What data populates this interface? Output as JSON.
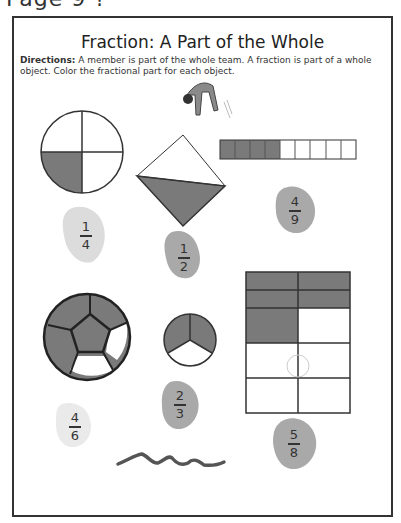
{
  "page_header": "Page 9 ?",
  "worksheet": {
    "title": "Fraction: A Part of the Whole",
    "directions_label": "Directions:",
    "directions_text": " A member is part of the whole team. A fraction is part of a whole object. Color the fractional part for each object."
  },
  "colors": {
    "shade": "#7a7a7a",
    "outline": "#333333",
    "blob_light": "#dcdcdc",
    "blob_dark": "#a9a9a9"
  },
  "objects": [
    {
      "name": "circle-quarters",
      "parts": 4,
      "shaded": 1,
      "fraction": {
        "num": "1",
        "den": "4"
      }
    },
    {
      "name": "diamond-halves",
      "parts": 2,
      "shaded": 1,
      "fraction": {
        "num": "1",
        "den": "2"
      }
    },
    {
      "name": "bar-ninths",
      "parts": 9,
      "shaded": 4,
      "fraction": {
        "num": "4",
        "den": "9"
      }
    },
    {
      "name": "soccer-ball",
      "parts": 6,
      "shaded": 4,
      "fraction": {
        "num": "4",
        "den": "6"
      }
    },
    {
      "name": "circle-thirds",
      "parts": 3,
      "shaded": 2,
      "fraction": {
        "num": "2",
        "den": "3"
      }
    },
    {
      "name": "grid-eighths",
      "parts": 8,
      "shaded": 5,
      "fraction": {
        "num": "5",
        "den": "8"
      }
    }
  ]
}
